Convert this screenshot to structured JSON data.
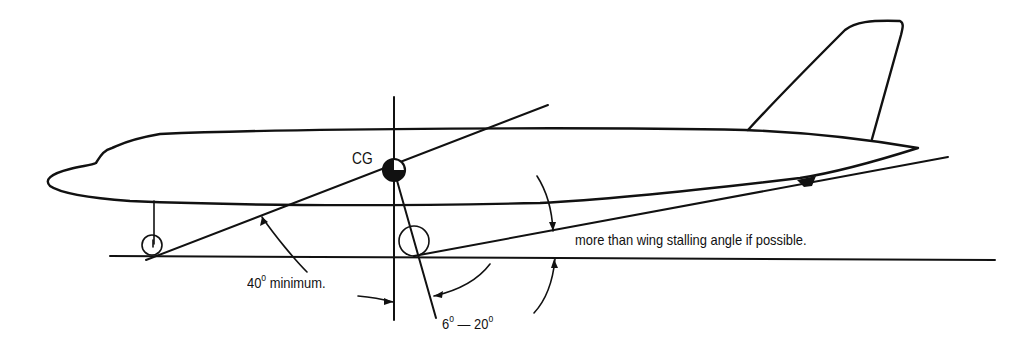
{
  "diagram": {
    "type": "aircraft ground-clearance / tip-back angle diagram",
    "labels": {
      "cg": "CG",
      "angle_40": "40",
      "angle_40_suffix": " minimum.",
      "angle_6": "6",
      "angle_dash": " — ",
      "angle_20": "20",
      "degree": "o",
      "stall_note": "more than wing stalling angle if possible."
    },
    "elements": [
      "fuselage-outline",
      "vertical-tail-fin",
      "nose-gear-strut",
      "nose-wheel",
      "main-wheel",
      "ground-line",
      "cg-vertical-line",
      "cg-symbol",
      "tip-back-line",
      "main-gear-angle-line",
      "tail-clearance-line",
      "tail-bumper"
    ],
    "colors": {
      "ink": "#111111",
      "background": "#ffffff"
    }
  }
}
